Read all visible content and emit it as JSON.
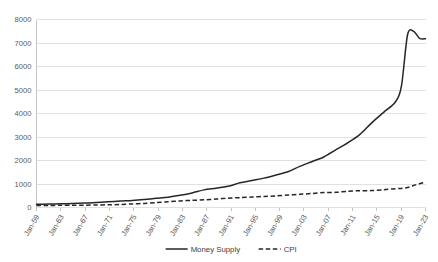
{
  "chart_data": {
    "type": "line",
    "title": "",
    "xlabel": "",
    "ylabel": "",
    "ylim": [
      0,
      8000
    ],
    "yticks": [
      0,
      1000,
      2000,
      3000,
      4000,
      5000,
      6000,
      7000,
      8000
    ],
    "ytick_labels": [
      "0",
      "1000",
      "2000",
      "3000",
      "4000",
      "5000",
      "6000",
      "7000",
      "8000"
    ],
    "grid": true,
    "legend_position": "bottom",
    "xtick_labels": [
      "Jan-59",
      "Jan-63",
      "Jan-67",
      "Jan-71",
      "Jan-75",
      "Jan-79",
      "Jan-83",
      "Jan-87",
      "Jan-91",
      "Jan-95",
      "Jan-99",
      "Jan-03",
      "Jan-07",
      "Jan-11",
      "Jan-15",
      "Jan-19",
      "Jan-23"
    ],
    "x": [
      1959,
      1961,
      1963,
      1965,
      1967,
      1969,
      1971,
      1973,
      1975,
      1977,
      1979,
      1981,
      1983,
      1985,
      1987,
      1989,
      1991,
      1993,
      1995,
      1997,
      1999,
      2001,
      2003,
      2005,
      2007,
      2009,
      2011,
      2013,
      2015,
      2017,
      2019,
      2020,
      2021,
      2022,
      2023,
      2024
    ],
    "series": [
      {
        "name": "Money Supply",
        "style": "solid",
        "color": "#262626",
        "values": [
          140,
          145,
          155,
          170,
          190,
          210,
          240,
          275,
          300,
          340,
          390,
          440,
          520,
          620,
          750,
          820,
          900,
          1050,
          1150,
          1250,
          1380,
          1520,
          1750,
          1950,
          2150,
          2450,
          2750,
          3100,
          3600,
          4050,
          4500,
          5200,
          7350,
          7500,
          7200,
          7180
        ]
      },
      {
        "name": "CPI",
        "style": "dashed",
        "color": "#262626",
        "values": [
          85,
          88,
          91,
          94,
          98,
          105,
          115,
          128,
          152,
          175,
          205,
          245,
          280,
          305,
          325,
          360,
          395,
          420,
          445,
          470,
          495,
          530,
          560,
          595,
          640,
          645,
          690,
          715,
          720,
          755,
          800,
          810,
          850,
          940,
          1010,
          1080
        ]
      }
    ],
    "legend": [
      {
        "label": "Money Supply",
        "style": "solid"
      },
      {
        "label": "CPI",
        "style": "dashed"
      }
    ]
  },
  "colors": {
    "gridline": "#d9d9d9",
    "axis": "#bfbfbf",
    "text": "#595959",
    "series": "#262626",
    "background": "#ffffff"
  }
}
